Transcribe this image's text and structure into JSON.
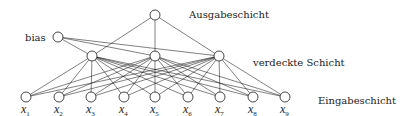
{
  "labels": {
    "output_layer": "Ausgabeschicht",
    "bias": "bias",
    "hidden_layer": "verdeckte Schicht",
    "input_layer": "Eingabeschicht"
  },
  "nodes": {
    "output": {
      "x": 155,
      "y": 15
    },
    "bias": {
      "x": 58,
      "y": 37
    },
    "hidden": [
      {
        "x": 92,
        "y": 56
      },
      {
        "x": 155,
        "y": 56
      },
      {
        "x": 219,
        "y": 56
      }
    ],
    "inputs": [
      {
        "x": 26,
        "y": 97,
        "var": "x",
        "sub": "1"
      },
      {
        "x": 59,
        "y": 97,
        "var": "x",
        "sub": "2"
      },
      {
        "x": 91,
        "y": 97,
        "var": "x",
        "sub": "3"
      },
      {
        "x": 124,
        "y": 97,
        "var": "x",
        "sub": "4"
      },
      {
        "x": 155,
        "y": 97,
        "var": "x",
        "sub": "5"
      },
      {
        "x": 188,
        "y": 97,
        "var": "x",
        "sub": "6"
      },
      {
        "x": 220,
        "y": 97,
        "var": "x",
        "sub": "7"
      },
      {
        "x": 253,
        "y": 97,
        "var": "x",
        "sub": "8"
      },
      {
        "x": 285,
        "y": 97,
        "var": "x",
        "sub": "9"
      }
    ]
  },
  "node_radius": 5,
  "colors": {
    "stroke": "#1a1a1a",
    "background": "#ffffff"
  }
}
